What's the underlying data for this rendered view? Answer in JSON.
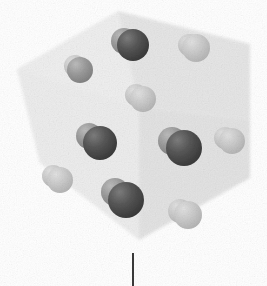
{
  "figure": {
    "type": "crystal-unit-cell-diagram",
    "caption_text": "",
    "background_color": "#ffffff"
  },
  "unit_cell": {
    "name": "unit-cell-box",
    "description": "Cube drawn in oblique/isometric projection with three visible shaded faces",
    "edge_color": "#d8d8d8",
    "vertices": {
      "top_apex": [
        118,
        11
      ],
      "left_upper": [
        17,
        69
      ],
      "right_upper": [
        250,
        44
      ],
      "front_center": [
        139,
        107
      ],
      "left_lower": [
        17,
        200
      ],
      "right_lower": [
        250,
        178
      ],
      "front_lower": [
        139,
        240
      ],
      "back_hidden": [
        118,
        145
      ]
    },
    "faces": [
      {
        "name": "top-left-face",
        "fill": "#efefef",
        "points": "17,69 118,11 139,107 40,163"
      },
      {
        "name": "top-right-face",
        "fill": "#e6e6e6",
        "points": "118,11 250,44 250,120 139,107"
      },
      {
        "name": "front-left-face",
        "fill": "#ededed",
        "points": "17,69 40,163 139,240 139,107"
      },
      {
        "name": "front-right-face",
        "fill": "#e3e3e3",
        "points": "139,107 250,120 250,178 139,240"
      }
    ]
  },
  "atoms": {
    "legend": {
      "light_sphere_color": "#c9c9c9",
      "dark_sphere_color": "#4a4a4a",
      "mid_sphere_color": "#9a9a9a"
    },
    "count": 10,
    "items": [
      {
        "name": "atom-pair-top-center",
        "cx": 133,
        "cy": 45,
        "r": 16,
        "light_dx": -9,
        "light_dy": -4,
        "light_r": 13,
        "dark_shade": "dark",
        "light_shade": "mid"
      },
      {
        "name": "atom-pair-upper-left",
        "cx": 80,
        "cy": 70,
        "r": 13,
        "light_dx": -5,
        "light_dy": -4,
        "light_r": 11,
        "dark_shade": "mid",
        "light_shade": "light"
      },
      {
        "name": "atom-pair-upper-right",
        "cx": 196,
        "cy": 48,
        "r": 14,
        "light_dx": -7,
        "light_dy": -3,
        "light_r": 11,
        "dark_shade": "light",
        "light_shade": "light"
      },
      {
        "name": "atom-pair-center-upper",
        "cx": 143,
        "cy": 99,
        "r": 13,
        "light_dx": -7,
        "light_dy": -4,
        "light_r": 11,
        "dark_shade": "light",
        "light_shade": "light"
      },
      {
        "name": "atom-pair-mid-left",
        "cx": 100,
        "cy": 143,
        "r": 17,
        "light_dx": -11,
        "light_dy": -7,
        "light_r": 13,
        "dark_shade": "dark",
        "light_shade": "mid"
      },
      {
        "name": "atom-pair-mid-right",
        "cx": 184,
        "cy": 148,
        "r": 18,
        "light_dx": -12,
        "light_dy": -7,
        "light_r": 14,
        "dark_shade": "dark",
        "light_shade": "mid"
      },
      {
        "name": "atom-pair-right-edge",
        "cx": 232,
        "cy": 141,
        "r": 13,
        "light_dx": -7,
        "light_dy": -3,
        "light_r": 11,
        "dark_shade": "light",
        "light_shade": "light"
      },
      {
        "name": "atom-pair-lower-left",
        "cx": 60,
        "cy": 180,
        "r": 13,
        "light_dx": -7,
        "light_dy": -4,
        "light_r": 11,
        "dark_shade": "light",
        "light_shade": "light"
      },
      {
        "name": "atom-pair-lower-center",
        "cx": 126,
        "cy": 200,
        "r": 18,
        "light_dx": -11,
        "light_dy": -8,
        "light_r": 14,
        "dark_shade": "dark",
        "light_shade": "mid"
      },
      {
        "name": "atom-pair-lower-right",
        "cx": 188,
        "cy": 215,
        "r": 14,
        "light_dx": -8,
        "light_dy": -4,
        "light_r": 12,
        "dark_shade": "light",
        "light_shade": "light"
      }
    ]
  },
  "scale_marker": {
    "name": "vertical-tick-line",
    "x": 133,
    "y_top": 253,
    "y_bottom": 286,
    "color": "#3a3a3a",
    "width": 2,
    "label": ""
  }
}
